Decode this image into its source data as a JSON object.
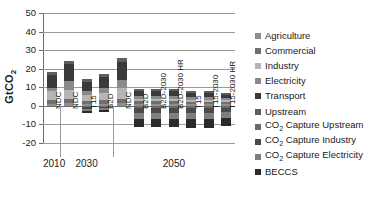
{
  "chart_data": {
    "type": "bar",
    "stacked": true,
    "title": "",
    "xlabel": "",
    "ylabel": "GtCO2",
    "ylabel_display": "GtCO",
    "ylabel_sub": "2",
    "ylim": [
      -20,
      50
    ],
    "yticks": [
      50,
      40,
      30,
      20,
      10,
      0,
      -10,
      -20
    ],
    "grid": true,
    "legend_position": "right",
    "groups": [
      {
        "label": "2010",
        "count": 1
      },
      {
        "label": "2030",
        "count": 3
      },
      {
        "label": "2050",
        "count": 7
      }
    ],
    "categories": [
      "NDC",
      "NDC",
      "T15",
      "B2D",
      "NDC",
      "B2D",
      "B2D-2030",
      "B2D-2030 HR",
      "T15",
      "T15-2030",
      "T15-2030 HR"
    ],
    "series": [
      {
        "name": "Agriculture",
        "color": "#8f8f8f",
        "values": [
          1.2,
          1.3,
          1.1,
          1.2,
          1.4,
          1.2,
          1.2,
          1.2,
          1.1,
          1.1,
          1.0
        ]
      },
      {
        "name": "Commercial",
        "color": "#6f6f6f",
        "values": [
          2.0,
          2.2,
          1.5,
          1.8,
          2.4,
          1.2,
          1.2,
          1.2,
          1.0,
          1.0,
          0.9
        ]
      },
      {
        "name": "Industry",
        "color": "#b5b5b5",
        "values": [
          5.0,
          5.3,
          3.2,
          4.0,
          5.6,
          1.5,
          1.5,
          1.5,
          1.3,
          1.3,
          1.1
        ]
      },
      {
        "name": "Electricity",
        "color": "#8a8a8a",
        "values": [
          1.3,
          4.5,
          2.3,
          2.5,
          4.7,
          1.6,
          1.6,
          1.6,
          1.3,
          1.3,
          1.0
        ]
      },
      {
        "name": "Transport",
        "color": "#3a3a3a",
        "values": [
          7.0,
          9.0,
          5.0,
          6.0,
          9.5,
          2.6,
          2.7,
          2.7,
          2.2,
          2.2,
          1.9
        ]
      },
      {
        "name": "Upstream",
        "color": "#5e5e5e",
        "values": [
          2.0,
          2.0,
          1.5,
          1.7,
          2.1,
          1.0,
          1.0,
          1.0,
          0.9,
          0.9,
          0.8
        ]
      },
      {
        "name": "CO2 Capture Upstream",
        "color": "#6b6b6b",
        "values": [
          0.0,
          0.0,
          -0.6,
          -0.5,
          0.0,
          -1.1,
          -1.1,
          -1.1,
          -1.2,
          -1.2,
          -1.0
        ]
      },
      {
        "name": "CO2 Capture Industry",
        "color": "#4a4a4a",
        "values": [
          0.0,
          0.0,
          -1.2,
          -0.9,
          0.0,
          -2.5,
          -2.5,
          -2.5,
          -2.6,
          -2.6,
          -2.3
        ]
      },
      {
        "name": "CO2 Capture Electricity",
        "color": "#7e7e7e",
        "values": [
          0.0,
          0.0,
          -1.0,
          -0.8,
          0.0,
          -3.3,
          -3.3,
          -3.3,
          -3.5,
          -3.5,
          -3.1
        ]
      },
      {
        "name": "BECCS",
        "color": "#2b2b2b",
        "values": [
          0.0,
          0.0,
          -1.2,
          -1.0,
          0.0,
          -4.6,
          -4.6,
          -4.6,
          -4.8,
          -4.8,
          -4.3
        ]
      }
    ],
    "legend_entries": [
      {
        "label": "Agriculture",
        "sub": null,
        "color": "#8f8f8f"
      },
      {
        "label": "Commercial",
        "sub": null,
        "color": "#6f6f6f"
      },
      {
        "label": "Industry",
        "sub": null,
        "color": "#b5b5b5"
      },
      {
        "label": "Electricity",
        "sub": null,
        "color": "#8a8a8a"
      },
      {
        "label": "Transport",
        "sub": null,
        "color": "#3a3a3a"
      },
      {
        "label": "Upstream",
        "sub": null,
        "color": "#5e5e5e"
      },
      {
        "label": "CO",
        "sub": "2",
        "suffix": " Capture Upstream",
        "color": "#6b6b6b"
      },
      {
        "label": "CO",
        "sub": "2",
        "suffix": " Capture Industry",
        "color": "#4a4a4a"
      },
      {
        "label": "CO",
        "sub": "2",
        "suffix": " Capture Electricity",
        "color": "#7e7e7e"
      },
      {
        "label": "BECCS",
        "sub": null,
        "color": "#2b2b2b"
      }
    ]
  }
}
